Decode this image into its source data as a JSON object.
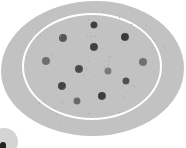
{
  "image": {
    "description": "Grayscale illustration of an oval dish with a white inner ring and scattered dark spots",
    "colors": {
      "background": "#ffffff",
      "dish": "#c2c2c2",
      "ring": "#ffffff",
      "spot_dark": "#4a4a4a",
      "spot_mid": "#6e6e6e"
    },
    "spots": [
      {
        "x": 94,
        "y": 25,
        "r": 3.5,
        "color": "#3f3f3f"
      },
      {
        "x": 63,
        "y": 38,
        "r": 4,
        "color": "#555555"
      },
      {
        "x": 125,
        "y": 37,
        "r": 4,
        "color": "#3a3a3a"
      },
      {
        "x": 94,
        "y": 47,
        "r": 4,
        "color": "#404040"
      },
      {
        "x": 46,
        "y": 61,
        "r": 4,
        "color": "#6e6e6e"
      },
      {
        "x": 143,
        "y": 62,
        "r": 4,
        "color": "#707070"
      },
      {
        "x": 79,
        "y": 69,
        "r": 4,
        "color": "#4a4a4a"
      },
      {
        "x": 108,
        "y": 71,
        "r": 3.5,
        "color": "#7a7a7a"
      },
      {
        "x": 126,
        "y": 81,
        "r": 3.5,
        "color": "#4f4f4f"
      },
      {
        "x": 62,
        "y": 86,
        "r": 4,
        "color": "#444444"
      },
      {
        "x": 102,
        "y": 96,
        "r": 4,
        "color": "#3e3e3e"
      },
      {
        "x": 77,
        "y": 101,
        "r": 3.5,
        "color": "#6a6a6a"
      }
    ]
  }
}
